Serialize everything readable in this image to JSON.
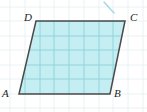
{
  "figure": {
    "shape_name": "parallelogram",
    "background_color": "#ffffff",
    "fill_color": "#c5eef2",
    "outline_color": "#4a4a4a",
    "grid_color_inner": "#7fcdd6",
    "grid_color_outer": "#e4eff1",
    "mark_color": "#a9d9e8",
    "label_color": "#1d1d1f",
    "vertices": [
      {
        "name": "A",
        "label": "A",
        "x": 19,
        "y": 94
      },
      {
        "name": "B",
        "label": "B",
        "x": 110,
        "y": 94
      },
      {
        "name": "C",
        "label": "C",
        "x": 125,
        "y": 21
      },
      {
        "name": "D",
        "label": "D",
        "x": 36,
        "y": 21
      }
    ],
    "grid": {
      "spacing_x": 14.8,
      "spacing_y": 14.6,
      "vertical_lines": [
        10,
        25,
        40,
        54,
        69,
        84,
        99,
        113,
        128,
        143
      ],
      "horizontal_lines": [
        7,
        21,
        36,
        50,
        65,
        79,
        94,
        108
      ]
    },
    "stray_mark": {
      "name": "diagonal-tick",
      "x1": 104,
      "y1": 2,
      "x2": 114,
      "y2": 13
    }
  }
}
